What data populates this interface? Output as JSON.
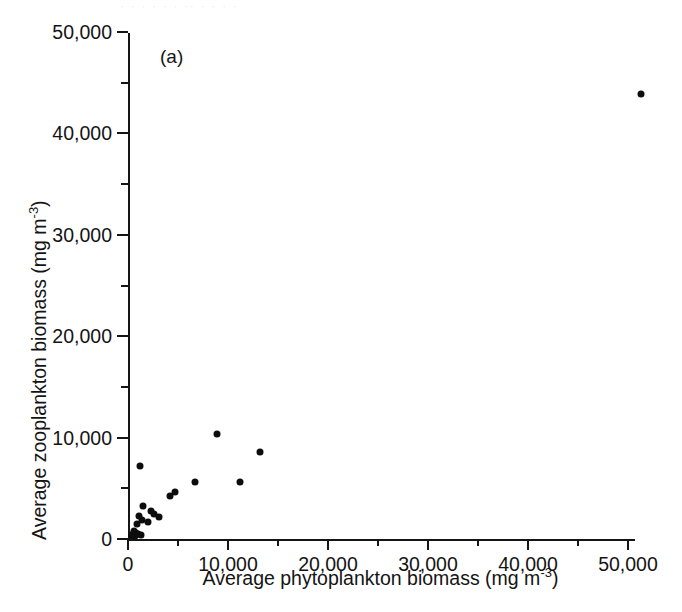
{
  "figure": {
    "panel_label": "(a)",
    "bleed_text": "· · ·  ·  · ·  ·· ·  · · ·",
    "ink_color": "#0d0d0d",
    "background_color": "#ffffff"
  },
  "chart_data": {
    "type": "scatter",
    "title": "",
    "panel": "(a)",
    "xlabel": "Average phytoplankton biomass (mg m",
    "xlabel_exponent": "-3",
    "xlabel_tail": ")",
    "ylabel": "Average zooplankton biomass (mg m",
    "ylabel_exponent": "-3",
    "ylabel_tail": ")",
    "xlim": [
      0,
      51500
    ],
    "ylim": [
      0,
      50000
    ],
    "grid": false,
    "legend": null,
    "x_ticks": [
      0,
      10000,
      20000,
      30000,
      40000,
      50000
    ],
    "x_tick_labels": [
      "0",
      "10,000",
      "20,000",
      "30,000",
      "40,000",
      "50,000"
    ],
    "x_minor_ticks": [
      5000,
      15000,
      25000,
      35000,
      45000
    ],
    "y_ticks": [
      0,
      10000,
      20000,
      30000,
      40000,
      50000
    ],
    "y_tick_labels": [
      "0",
      "10,000",
      "20,000",
      "30,000",
      "40,000",
      "50,000"
    ],
    "y_minor_ticks": [
      5000,
      15000,
      25000,
      35000,
      45000
    ],
    "marker": "filled-circle",
    "marker_color": "#0d0d0d",
    "points": [
      {
        "x": 51300,
        "y": 43900
      },
      {
        "x": 8900,
        "y": 10400
      },
      {
        "x": 13200,
        "y": 8600
      },
      {
        "x": 11200,
        "y": 5600
      },
      {
        "x": 6700,
        "y": 5600
      },
      {
        "x": 1200,
        "y": 7200
      },
      {
        "x": 4200,
        "y": 4200
      },
      {
        "x": 4700,
        "y": 4600
      },
      {
        "x": 1500,
        "y": 3300
      },
      {
        "x": 2300,
        "y": 2800
      },
      {
        "x": 2600,
        "y": 2500
      },
      {
        "x": 3100,
        "y": 2200
      },
      {
        "x": 1100,
        "y": 2300
      },
      {
        "x": 1400,
        "y": 1900
      },
      {
        "x": 2000,
        "y": 1700
      },
      {
        "x": 900,
        "y": 1500
      },
      {
        "x": 600,
        "y": 800
      },
      {
        "x": 800,
        "y": 600
      },
      {
        "x": 500,
        "y": 500
      },
      {
        "x": 1000,
        "y": 450
      },
      {
        "x": 1300,
        "y": 400
      },
      {
        "x": 400,
        "y": 300
      },
      {
        "x": 700,
        "y": 250
      }
    ]
  }
}
